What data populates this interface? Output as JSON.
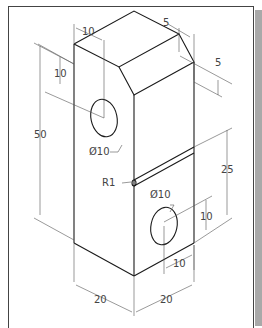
{
  "drawing": {
    "type": "isometric-mechanical-part",
    "dimensions": {
      "top_hole_offset_x": "10",
      "top_hole_offset_y": "10",
      "chamfer_width": "5",
      "chamfer_height": "5",
      "overall_height": "50",
      "top_hole_diameter": "Ø10",
      "groove_radius": "R1",
      "lower_hole_diameter": "Ø10",
      "groove_height": "25",
      "lower_hole_offset_y": "10",
      "lower_hole_offset_x": "10",
      "width_left": "20",
      "width_right": "20"
    },
    "colors": {
      "line": "#1a1a1a",
      "dimension_line": "#555555",
      "text": "#444444",
      "frame": "#444444",
      "shadow": "#a9a9a9",
      "background": "#ffffff"
    }
  }
}
